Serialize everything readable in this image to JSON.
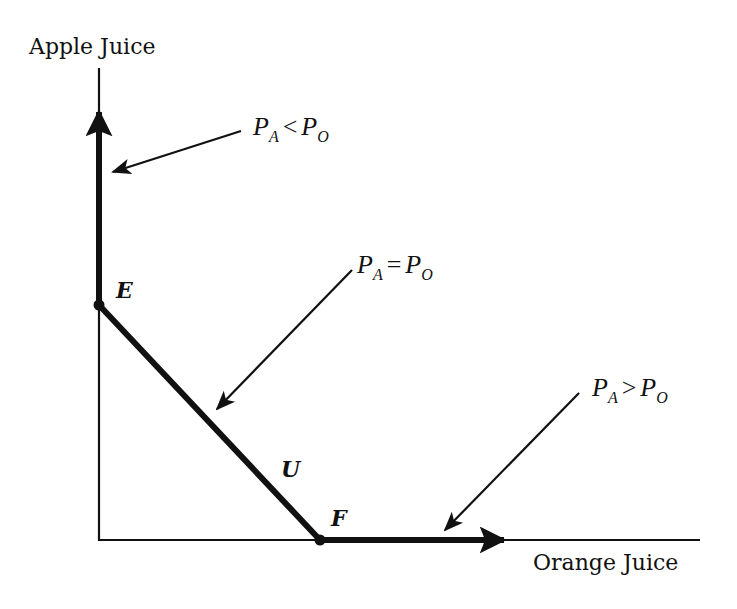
{
  "diagram": {
    "type": "budget-line-corner-solutions",
    "axes": {
      "y_label": "Apple Juice",
      "x_label": "Orange Juice"
    },
    "points": [
      {
        "id": "E",
        "label": "E"
      },
      {
        "id": "U",
        "label": "U"
      },
      {
        "id": "F",
        "label": "F"
      }
    ],
    "annotations": [
      {
        "id": "pa-lt-po",
        "var1": "P",
        "sub1": "A",
        "op": "<",
        "var2": "P",
        "sub2": "O"
      },
      {
        "id": "pa-eq-po",
        "var1": "P",
        "sub1": "A",
        "op": "=",
        "var2": "P",
        "sub2": "O"
      },
      {
        "id": "pa-gt-po",
        "var1": "P",
        "sub1": "A",
        "op": ">",
        "var2": "P",
        "sub2": "O"
      }
    ],
    "colors": {
      "ink": "#111111",
      "background": "#ffffff"
    }
  }
}
